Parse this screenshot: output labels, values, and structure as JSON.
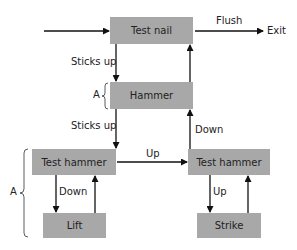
{
  "diagram": {
    "nodes": {
      "test_nail": "Test nail",
      "hammer": "Hammer",
      "test_hammer_left": "Test hammer",
      "lift": "Lift",
      "test_hammer_right": "Test hammer",
      "strike": "Strike"
    },
    "edges": {
      "flush": "Flush",
      "exit": "Exit",
      "sticks_up_1": "Sticks up",
      "sticks_up_2": "Sticks up",
      "up_horizontal": "Up",
      "down_left": "Down",
      "down_right": "Down",
      "up_right": "Up"
    },
    "brackets": {
      "a_small": "A",
      "a_large": "A"
    },
    "colors": {
      "box_fill": "#a8a8a8",
      "line": "#111111"
    }
  }
}
